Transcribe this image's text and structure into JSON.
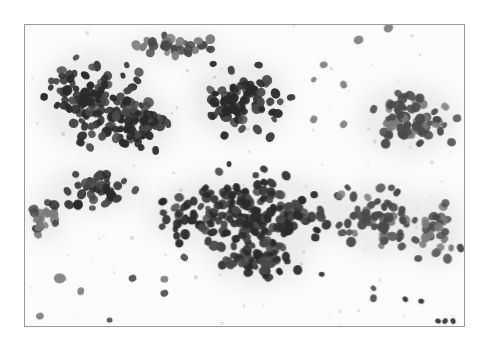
{
  "image": {
    "description": "Grayscale cytology micrograph showing clusters of round, dark-staining nuclei on a pale background",
    "frame": {
      "x": 24,
      "y": 24,
      "width": 441,
      "height": 303,
      "border_color": "#9a9a9a",
      "background": "#fbfbfb"
    },
    "colors": {
      "nucleus_dark": "#2b2b2b",
      "nucleus_mid": "#4a4a4a",
      "nucleus_light": "#7c7c7c",
      "cytoplasm_haze": "#d9d9d9",
      "debris": "#bdbdbd"
    },
    "clusters": [
      {
        "name": "upper-left-cluster",
        "cx": 70,
        "cy": 75,
        "rx": 62,
        "ry": 55,
        "count": 110,
        "tone": "dark"
      },
      {
        "name": "upper-left-dense-core",
        "cx": 115,
        "cy": 100,
        "rx": 40,
        "ry": 35,
        "count": 60,
        "tone": "dark"
      },
      {
        "name": "upper-middle-cluster",
        "cx": 215,
        "cy": 75,
        "rx": 55,
        "ry": 45,
        "count": 85,
        "tone": "dark"
      },
      {
        "name": "top-strip-cluster",
        "cx": 150,
        "cy": 22,
        "rx": 55,
        "ry": 14,
        "count": 30,
        "tone": "mid"
      },
      {
        "name": "upper-right-cluster",
        "cx": 385,
        "cy": 95,
        "rx": 55,
        "ry": 40,
        "count": 70,
        "tone": "mid"
      },
      {
        "name": "center-band-cluster",
        "cx": 225,
        "cy": 190,
        "rx": 115,
        "ry": 45,
        "count": 190,
        "tone": "dark"
      },
      {
        "name": "center-lower-cluster",
        "cx": 235,
        "cy": 235,
        "rx": 55,
        "ry": 30,
        "count": 55,
        "tone": "dark"
      },
      {
        "name": "right-middle-cluster",
        "cx": 355,
        "cy": 195,
        "rx": 50,
        "ry": 40,
        "count": 60,
        "tone": "mid"
      },
      {
        "name": "far-right-cluster",
        "cx": 410,
        "cy": 205,
        "rx": 35,
        "ry": 40,
        "count": 35,
        "tone": "mid"
      },
      {
        "name": "left-lower-cluster",
        "cx": 20,
        "cy": 195,
        "rx": 22,
        "ry": 25,
        "count": 22,
        "tone": "mid"
      },
      {
        "name": "left-middle-cluster",
        "cx": 70,
        "cy": 165,
        "rx": 55,
        "ry": 25,
        "count": 40,
        "tone": "dark"
      }
    ],
    "scattered": [
      {
        "x": 35,
        "y": 255,
        "r": 6,
        "tone": "light"
      },
      {
        "x": 56,
        "y": 268,
        "r": 4,
        "tone": "light"
      },
      {
        "x": 108,
        "y": 255,
        "r": 4,
        "tone": "mid"
      },
      {
        "x": 140,
        "y": 270,
        "r": 4,
        "tone": "mid"
      },
      {
        "x": 140,
        "y": 256,
        "r": 4,
        "tone": "light"
      },
      {
        "x": 160,
        "y": 234,
        "r": 4,
        "tone": "mid"
      },
      {
        "x": 298,
        "y": 251,
        "r": 3,
        "tone": "dark"
      },
      {
        "x": 350,
        "y": 275,
        "r": 4,
        "tone": "mid"
      },
      {
        "x": 382,
        "y": 276,
        "r": 3,
        "tone": "dark"
      },
      {
        "x": 398,
        "y": 278,
        "r": 3,
        "tone": "dark"
      },
      {
        "x": 415,
        "y": 298,
        "r": 3,
        "tone": "dark"
      },
      {
        "x": 422,
        "y": 298,
        "r": 3,
        "tone": "dark"
      },
      {
        "x": 430,
        "y": 298,
        "r": 3,
        "tone": "dark"
      },
      {
        "x": 15,
        "y": 293,
        "r": 4,
        "tone": "light"
      },
      {
        "x": 85,
        "y": 297,
        "r": 3,
        "tone": "mid"
      },
      {
        "x": 300,
        "y": 40,
        "r": 4,
        "tone": "light"
      },
      {
        "x": 320,
        "y": 60,
        "r": 4,
        "tone": "light"
      },
      {
        "x": 290,
        "y": 55,
        "r": 3,
        "tone": "light"
      },
      {
        "x": 335,
        "y": 15,
        "r": 5,
        "tone": "light"
      },
      {
        "x": 365,
        "y": 3,
        "r": 5,
        "tone": "light"
      },
      {
        "x": 320,
        "y": 100,
        "r": 4,
        "tone": "light"
      },
      {
        "x": 290,
        "y": 95,
        "r": 4,
        "tone": "light"
      },
      {
        "x": 240,
        "y": 145,
        "r": 4,
        "tone": "dark"
      },
      {
        "x": 205,
        "y": 140,
        "r": 3,
        "tone": "dark"
      },
      {
        "x": 350,
        "y": 265,
        "r": 3,
        "tone": "mid"
      },
      {
        "x": 395,
        "y": 235,
        "r": 4,
        "tone": "mid"
      }
    ],
    "seed": 1337
  }
}
